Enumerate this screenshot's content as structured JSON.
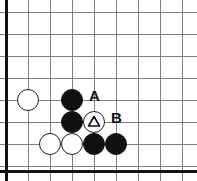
{
  "figure": {
    "name": "go-board-diagram",
    "kind": "go-board",
    "width": 197,
    "height": 181,
    "background_color": "#ffffff"
  },
  "board": {
    "line_color": "#808080",
    "edge_color": "#111111",
    "grid_spacing": 22,
    "origin_x": 6,
    "origin_y": 12,
    "columns": 9,
    "rows": 8,
    "edges_shown": [
      "left",
      "bottom"
    ],
    "vertical_line_x": [
      6,
      28,
      50,
      72,
      94,
      116,
      138,
      160,
      182
    ],
    "horizontal_line_y": [
      12,
      34,
      56,
      78,
      100,
      122,
      144,
      166
    ],
    "left_edge_x": 6,
    "bottom_edge_y": 171
  },
  "stones": {
    "radius": 11,
    "black_color": "#111111",
    "white_color": "#ffffff",
    "white_border_color": "#222222",
    "items": [
      {
        "id": "white-left",
        "color": "white",
        "cx": 28,
        "cy": 100,
        "mark": "none"
      },
      {
        "id": "black-upper",
        "color": "black",
        "cx": 72,
        "cy": 100,
        "mark": "none"
      },
      {
        "id": "black-middle",
        "color": "black",
        "cx": 72,
        "cy": 122,
        "mark": "none"
      },
      {
        "id": "white-triangle",
        "color": "white",
        "cx": 94,
        "cy": 122,
        "mark": "triangle"
      },
      {
        "id": "white-bottom-left",
        "color": "white",
        "cx": 50,
        "cy": 144,
        "mark": "none"
      },
      {
        "id": "white-bottom-mid",
        "color": "white",
        "cx": 72,
        "cy": 144,
        "mark": "none"
      },
      {
        "id": "black-bottom-mid",
        "color": "black",
        "cx": 94,
        "cy": 144,
        "mark": "none"
      },
      {
        "id": "black-bottom-right",
        "color": "black",
        "cx": 116,
        "cy": 144,
        "mark": "none"
      }
    ]
  },
  "labels": {
    "items": [
      {
        "id": "label-a",
        "text": "A",
        "x": 89,
        "y": 88,
        "color": "#111111"
      },
      {
        "id": "label-b",
        "text": "B",
        "x": 111,
        "y": 110,
        "color": "#111111"
      }
    ]
  }
}
